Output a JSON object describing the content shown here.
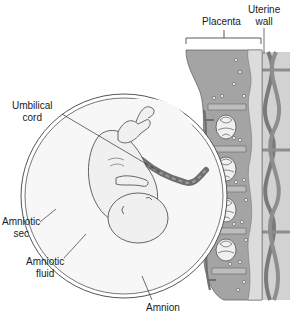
{
  "diagram": {
    "labels": {
      "placenta": "Placenta",
      "uterine_wall_line1": "Uterine",
      "uterine_wall_line2": "wall",
      "umbilical_cord_line1": "Umbilical",
      "umbilical_cord_line2": "cord",
      "amniotic_sac_line1": "Amniotic",
      "amniotic_sac_line2": "sec",
      "amniotic_fluid_line1": "Amniotic",
      "amniotic_fluid_line2": "fluid",
      "amnion": "Amnion"
    },
    "colors": {
      "placenta_dark": "#8a8a8a",
      "placenta_mid": "#a8a8a8",
      "uterine_wall": "#b8b8b8",
      "vessel": "#6e6e6e",
      "fluid": "#f4f4f4",
      "fetus": "#f0f0f0",
      "outline": "#555555"
    }
  }
}
